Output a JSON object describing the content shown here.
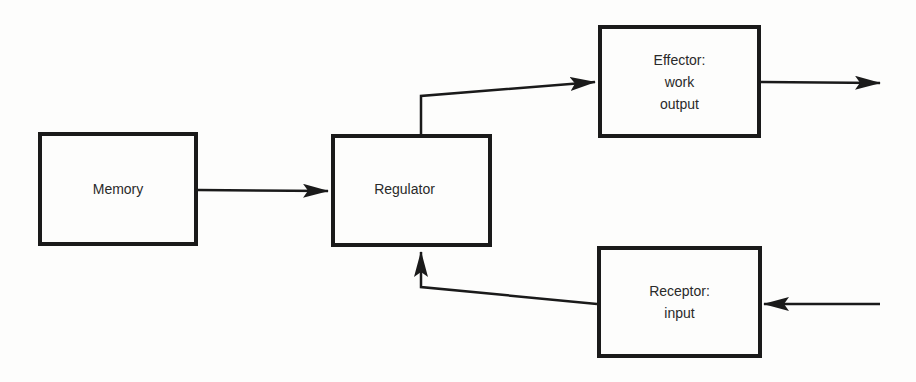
{
  "diagram": {
    "type": "block-flow",
    "colors": {
      "stroke": "#1a1a1a",
      "text": "#2a2a2a",
      "background": "#fdfdfc"
    },
    "nodes": [
      {
        "id": "memory",
        "label": "Memory"
      },
      {
        "id": "regulator",
        "label": "Regulator"
      },
      {
        "id": "effector",
        "label": "Effector:\nwork\noutput"
      },
      {
        "id": "receptor",
        "label": "Receptor:\ninput"
      }
    ],
    "edges": [
      {
        "from": "memory",
        "to": "regulator"
      },
      {
        "from": "regulator",
        "to": "effector"
      },
      {
        "from": "effector",
        "to": "external-output"
      },
      {
        "from": "external-input",
        "to": "receptor"
      },
      {
        "from": "receptor",
        "to": "regulator"
      }
    ]
  }
}
